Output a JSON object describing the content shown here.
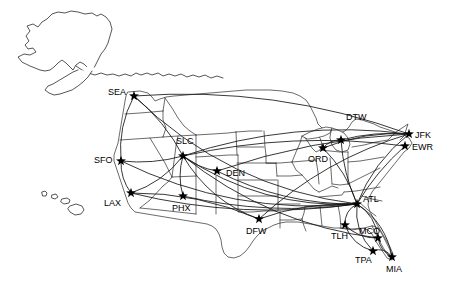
{
  "map": {
    "title": "US Airline Route Map",
    "background_color": "#ffffff",
    "border_color": "#2b2b2b",
    "route_color": "#141414",
    "marker_color": "#000000",
    "label_color": "#000000"
  },
  "chart_data": {
    "type": "scatter",
    "xlabel": "",
    "ylabel": "",
    "xlim": [
      0,
      450
    ],
    "ylim": [
      282,
      0
    ],
    "grid": false,
    "legend": "none",
    "projection": "albers-usa",
    "airports": [
      {
        "code": "SEA",
        "x": 134,
        "y": 96,
        "label_x": 108,
        "label_y": 95,
        "label_anchor": "start"
      },
      {
        "code": "SFO",
        "x": 121,
        "y": 161,
        "label_x": 94,
        "label_y": 163,
        "label_anchor": "start"
      },
      {
        "code": "LAX",
        "x": 131,
        "y": 193,
        "label_x": 104,
        "label_y": 206,
        "label_anchor": "start"
      },
      {
        "code": "SLC",
        "x": 183,
        "y": 156,
        "label_x": 176,
        "label_y": 144,
        "label_anchor": "start"
      },
      {
        "code": "PHX",
        "x": 183,
        "y": 196,
        "label_x": 172,
        "label_y": 211,
        "label_anchor": "start"
      },
      {
        "code": "DEN",
        "x": 217,
        "y": 171,
        "label_x": 226,
        "label_y": 176,
        "label_anchor": "start"
      },
      {
        "code": "DFW",
        "x": 259,
        "y": 219,
        "label_x": 246,
        "label_y": 234,
        "label_anchor": "start"
      },
      {
        "code": "ORD",
        "x": 323,
        "y": 148,
        "label_x": 308,
        "label_y": 162,
        "label_anchor": "start"
      },
      {
        "code": "DTW",
        "x": 341,
        "y": 140,
        "label_x": 346,
        "label_y": 120,
        "label_anchor": "start"
      },
      {
        "code": "JFK",
        "x": 409,
        "y": 134,
        "label_x": 415,
        "label_y": 138,
        "label_anchor": "start"
      },
      {
        "code": "EWR",
        "x": 405,
        "y": 146,
        "label_x": 412,
        "label_y": 150,
        "label_anchor": "start"
      },
      {
        "code": "ATL",
        "x": 357,
        "y": 204,
        "label_x": 363,
        "label_y": 202,
        "label_anchor": "start"
      },
      {
        "code": "TLH",
        "x": 345,
        "y": 225,
        "label_x": 331,
        "label_y": 239,
        "label_anchor": "start"
      },
      {
        "code": "MCO",
        "x": 378,
        "y": 238,
        "label_x": 359,
        "label_y": 234,
        "label_anchor": "start"
      },
      {
        "code": "TPA",
        "x": 373,
        "y": 251,
        "label_x": 355,
        "label_y": 263,
        "label_anchor": "start"
      },
      {
        "code": "MIA",
        "x": 392,
        "y": 257,
        "label_x": 386,
        "label_y": 272,
        "label_anchor": "start"
      }
    ],
    "routes": [
      {
        "from": "ATL",
        "to": "SEA",
        "curve": -42
      },
      {
        "from": "ATL",
        "to": "SFO",
        "curve": -34
      },
      {
        "from": "ATL",
        "to": "LAX",
        "curve": -22
      },
      {
        "from": "ATL",
        "to": "PHX",
        "curve": -16
      },
      {
        "from": "ATL",
        "to": "SLC",
        "curve": -30
      },
      {
        "from": "ATL",
        "to": "DEN",
        "curve": -18
      },
      {
        "from": "ATL",
        "to": "DFW",
        "curve": 10
      },
      {
        "from": "ATL",
        "to": "ORD",
        "curve": 8
      },
      {
        "from": "ATL",
        "to": "DTW",
        "curve": -6
      },
      {
        "from": "ATL",
        "to": "JFK",
        "curve": -12
      },
      {
        "from": "ATL",
        "to": "EWR",
        "curve": -6
      },
      {
        "from": "ATL",
        "to": "TLH",
        "curve": 8
      },
      {
        "from": "ATL",
        "to": "MCO",
        "curve": -10
      },
      {
        "from": "ATL",
        "to": "TPA",
        "curve": 12
      },
      {
        "from": "ATL",
        "to": "MIA",
        "curve": -14
      },
      {
        "from": "SLC",
        "to": "SEA",
        "curve": 8
      },
      {
        "from": "SLC",
        "to": "SFO",
        "curve": -6
      },
      {
        "from": "SLC",
        "to": "LAX",
        "curve": -10
      },
      {
        "from": "SLC",
        "to": "PHX",
        "curve": 6
      },
      {
        "from": "SLC",
        "to": "DEN",
        "curve": 5
      },
      {
        "from": "SLC",
        "to": "JFK",
        "curve": -26
      },
      {
        "from": "SLC",
        "to": "EWR",
        "curve": -20
      },
      {
        "from": "SLC",
        "to": "DFW",
        "curve": 18
      },
      {
        "from": "SLC",
        "to": "MCO",
        "curve": 30
      },
      {
        "from": "SEA",
        "to": "SFO",
        "curve": 10
      },
      {
        "from": "SEA",
        "to": "JFK",
        "curve": -30
      },
      {
        "from": "SFO",
        "to": "LAX",
        "curve": 6
      },
      {
        "from": "ORD",
        "to": "DTW",
        "curve": -5
      },
      {
        "from": "ORD",
        "to": "JFK",
        "curve": -10
      },
      {
        "from": "DTW",
        "to": "JFK",
        "curve": -6
      },
      {
        "from": "TLH",
        "to": "MCO",
        "curve": 8
      },
      {
        "from": "TLH",
        "to": "TPA",
        "curve": 10
      },
      {
        "from": "MCO",
        "to": "MIA",
        "curve": 6
      },
      {
        "from": "TPA",
        "to": "MIA",
        "curve": -8
      },
      {
        "from": "DFW",
        "to": "JFK",
        "curve": -20
      },
      {
        "from": "DFW",
        "to": "LAX",
        "curve": 14
      },
      {
        "from": "DEN",
        "to": "JFK",
        "curve": -14
      }
    ],
    "regions": [
      {
        "name": "alaska",
        "label": "Alaska"
      },
      {
        "name": "hawaii",
        "label": "Hawaii"
      },
      {
        "name": "conus",
        "label": "Contiguous United States"
      }
    ]
  }
}
